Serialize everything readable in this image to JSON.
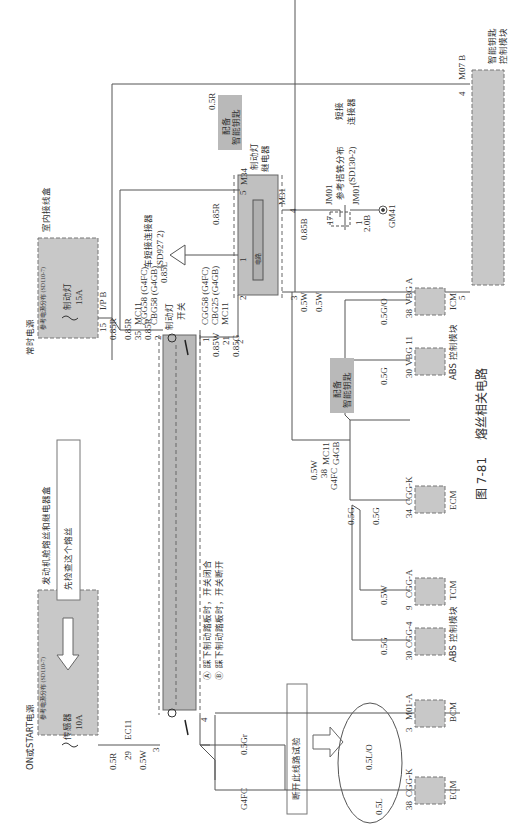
{
  "figure": {
    "number": "图 7-81",
    "title": "熔丝相关电路",
    "orientation": "rotated 90° counter-clockwise"
  },
  "colors": {
    "module_fill": "#c8c8c8",
    "module_border": "#707070",
    "wire": "#555555",
    "background": "#ffffff",
    "option_badge_fill": "#b9b9b9"
  },
  "boxes": {
    "interior_junction_box": {
      "label": "室内接线盒"
    },
    "engine_fuse_relay_box": {
      "label": "发动机舱熔丝和继电器盒"
    },
    "check_fuse_note": {
      "label": "先检查这个熔丝"
    },
    "disconnect_note": {
      "label": "断开此线路试验"
    }
  },
  "power_sources": {
    "constant": {
      "label": "常时电源",
      "ref": "参考电源分布 (SD110-7)",
      "fuse_name": "制动灯",
      "fuse_rating": "15A"
    },
    "on_start": {
      "label": "ON或START电源",
      "ref": "参考电源分布 (SD110-7)",
      "fuse_name": "传感器",
      "fuse_rating": "10A"
    }
  },
  "connectors": {
    "ip_b": {
      "name": "I/P B",
      "pin": "15"
    },
    "mc11_top": {
      "name": "MC11",
      "pin": "35"
    },
    "cgg58_a": {
      "line1": "CGG58 (G4FC)",
      "line2": "CBG58 (G4GB)",
      "pin": "2"
    },
    "cgg58_b": {
      "line1": "CGG58 (G4FC)",
      "line2": "CBG25 (G4GB)",
      "line3": "MC11",
      "pin_top": "1",
      "pin_mid": "21",
      "pin_bot": "2"
    },
    "ec11": {
      "name": "EC11",
      "pin": "29"
    },
    "switch_pin_3": "3",
    "switch_pin_4": "4",
    "m34": {
      "name": "M34",
      "pin": "5"
    },
    "m34_pin_1": "1",
    "m34_pin_2": "2",
    "m34_pin_3": "3",
    "m31": {
      "name": "M31",
      "pin": "4"
    },
    "jm01_a": {
      "name": "JM01",
      "pin": "17"
    },
    "jm01_b": {
      "name": "JM01",
      "pin": "1"
    },
    "gm41": {
      "name": "GM41"
    },
    "m07b": {
      "name": "M07 B",
      "pin_top": "4",
      "pin_bot": "5"
    },
    "mc11_g4gb": {
      "line1": "MC11",
      "line2": "G4GB",
      "pin": "38",
      "variant": "G4FC"
    },
    "short_connector": {
      "label": "车短接连接器",
      "ref": "(SD927 2)",
      "marker": "1"
    },
    "ground_dist": {
      "label": "参考搭铁分布",
      "ref": "(SD130-2)",
      "type1": "短接",
      "type2": "连接器"
    }
  },
  "components": {
    "brake_switch": {
      "label_line1": "制动灯",
      "label_line2": "开关",
      "mark_a": "A",
      "mark_b": "B"
    },
    "brake_relay": {
      "label_line1": "制动灯",
      "label_line2": "继电器",
      "inner": "电路"
    },
    "smart_key_module": {
      "line1": "智能钥匙",
      "line2": "控制模块"
    },
    "option_badge_1": {
      "line1": "配备",
      "line2": "智能钥匙"
    },
    "option_badge_2": {
      "line1": "配备",
      "line2": "智能钥匙"
    }
  },
  "notes": {
    "a": "Ⓐ 踩下制动踏板时，开关闭合",
    "b": "Ⓑ 踩下制动踏板时，开关断开"
  },
  "wires": {
    "w_085r_1": "0.85R",
    "w_085r_2": "0.85R",
    "w_085r_3": "0.85R",
    "w_085r_top": "0.85R",
    "w_085l": "0.85L",
    "w_05r_top": "0.5R",
    "w_085w": "0.85W",
    "w_085g": "0.85G",
    "w_05w_1": "0.5W",
    "w_05w_2": "0.5W",
    "w_05w_3": "0.5W",
    "w_085b": "0.85B",
    "w_20b": "2.0B",
    "w_05r_ec": "0.5R",
    "w_05w_ec": "0.5W",
    "w_05gr": "0.5Gr",
    "w_g4fc": "G4FC",
    "w_05go": "0.5G/O",
    "w_05g_vbg": "0.5G",
    "w_05g_a": "0.5G",
    "w_05g_b": "0.5G",
    "w_05w_tcm": "0.5W",
    "w_05g_abs": "0.5G",
    "w_05lo": "0.5L/O",
    "w_05l": "0.5L"
  },
  "loads": [
    {
      "module": "ICM",
      "connector": "VBG A",
      "pin": "38"
    },
    {
      "module": "ABS 控制模块",
      "connector": "VBG 11",
      "pin": "30"
    },
    {
      "module": "ECM",
      "connector": "CGG-K",
      "pin": "34"
    },
    {
      "module": "TCM",
      "connector": "CGG-A",
      "pin": "9"
    },
    {
      "module": "ABS 控制模块",
      "connector": "CGG-4",
      "pin": "30"
    },
    {
      "module": "BCM",
      "connector": "M01-A",
      "pin": "3"
    },
    {
      "module": "ECM",
      "connector": "CGG-K",
      "pin": "38"
    }
  ]
}
